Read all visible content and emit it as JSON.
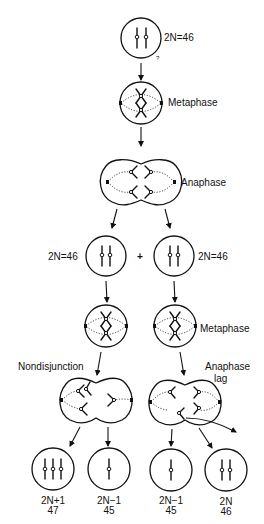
{
  "diagram": {
    "stages": {
      "parent": {
        "label": "2N=46"
      },
      "metaphase_1": {
        "label": "Metaphase"
      },
      "anaphase_1": {
        "label": "Anaphase"
      },
      "daughter_left": {
        "label": "2N=46"
      },
      "daughter_right": {
        "label": "2N=46"
      },
      "plus_sign": "+",
      "metaphase_2": {
        "label": "Metaphase"
      },
      "nondisjunction": {
        "label": "Nondisjunction"
      },
      "anaphase_lag": {
        "label_line1": "Anaphase",
        "label_line2": "lag"
      }
    },
    "outcomes": [
      {
        "ploidy": "2N+1",
        "count": "47",
        "chromosomes": 3
      },
      {
        "ploidy": "2N−1",
        "count": "45",
        "chromosomes": 1
      },
      {
        "ploidy": "2N−1",
        "count": "45",
        "chromosomes": 1
      },
      {
        "ploidy": "2N",
        "count": "46",
        "chromosomes": 2
      }
    ],
    "stray_mark": "?"
  }
}
